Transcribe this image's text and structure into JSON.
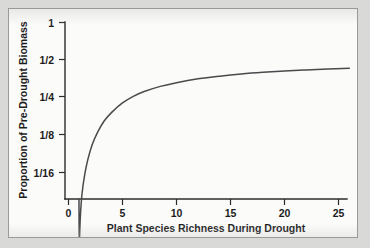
{
  "chart_data": {
    "type": "line",
    "title": "",
    "xlabel": "Plant Species Richness During Drought",
    "ylabel": "Proportion of Pre-Drought Biomass",
    "xlim": [
      -1.5,
      27.5
    ],
    "ylim_log2": [
      -5.0,
      0.0
    ],
    "grid": false,
    "legend": "none",
    "y_scale": "log2",
    "x_ticks": [
      0,
      5,
      10,
      15,
      20,
      25
    ],
    "x_tick_labels": [
      "0",
      "5",
      "10",
      "15",
      "20",
      "25"
    ],
    "y_ticks_log2": [
      0,
      -1,
      -2,
      -3,
      -4
    ],
    "y_tick_labels": [
      "1",
      "1/2",
      "1/4",
      "1/8",
      "1/16"
    ],
    "series": [
      {
        "name": "Proportion of pre-drought biomass",
        "color": "#4a4a4c",
        "x": [
          1.0,
          1.1,
          1.25,
          1.5,
          1.8,
          2.2,
          2.7,
          3.3,
          4.0,
          5.0,
          6.0,
          7.0,
          8.5,
          10.0,
          12.0,
          14.0,
          16.0,
          18.0,
          20.0,
          22.0,
          24.0,
          26.0
        ],
        "y": [
          0.018,
          0.028,
          0.042,
          0.06,
          0.08,
          0.105,
          0.132,
          0.162,
          0.19,
          0.226,
          0.255,
          0.279,
          0.307,
          0.329,
          0.353,
          0.371,
          0.386,
          0.398,
          0.408,
          0.416,
          0.423,
          0.429
        ],
        "y_labels_log2": [
          -5.8,
          -5.16,
          -4.57,
          -4.06,
          -3.64,
          -3.25,
          -2.92,
          -2.63,
          -2.4,
          -2.15,
          -1.97,
          -1.84,
          -1.7,
          -1.6,
          -1.5,
          -1.43,
          -1.37,
          -1.33,
          -1.29,
          -1.26,
          -1.24,
          -1.22
        ]
      }
    ],
    "annotations": []
  },
  "axes": {
    "y_title": "Proportion of Pre-Drought Biomass",
    "x_title": "Plant Species Richness During Drought"
  }
}
